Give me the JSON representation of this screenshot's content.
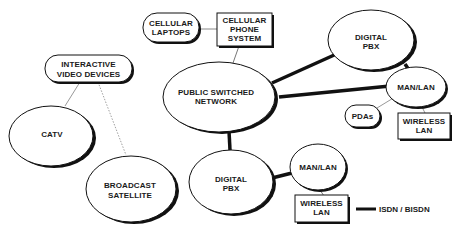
{
  "diagram": {
    "type": "network-topology",
    "nodes": {
      "cellular_laptops": {
        "line1": "CELLULAR",
        "line2": "LAPTOPS",
        "shape": "pill"
      },
      "cellular_phone_system": {
        "line1": "CELLULAR",
        "line2": "PHONE",
        "line3": "SYSTEM",
        "shape": "box"
      },
      "public_switched_network": {
        "line1": "PUBLIC SWITCHED",
        "line2": "NETWORK",
        "shape": "ellipse"
      },
      "digital_pbx_top": {
        "line1": "DIGITAL",
        "line2": "PBX",
        "shape": "ellipse"
      },
      "man_lan_right": {
        "line1": "MAN/LAN",
        "shape": "ellipse"
      },
      "pdas": {
        "line1": "PDAs",
        "shape": "pill"
      },
      "wireless_lan_right": {
        "line1": "WIRELESS",
        "line2": "LAN",
        "shape": "box"
      },
      "interactive_video_devices": {
        "line1": "INTERACTIVE",
        "line2": "VIDEO DEVICES",
        "shape": "pill"
      },
      "catv": {
        "line1": "CATV",
        "shape": "ellipse"
      },
      "broadcast_satellite": {
        "line1": "BROADCAST",
        "line2": "SATELLITE",
        "shape": "ellipse"
      },
      "digital_pbx_bottom": {
        "line1": "DIGITAL",
        "line2": "PBX",
        "shape": "ellipse"
      },
      "man_lan_bottom": {
        "line1": "MAN/LAN",
        "shape": "ellipse"
      },
      "wireless_lan_bottom": {
        "line1": "WIRELESS",
        "line2": "LAN",
        "shape": "box"
      }
    },
    "edges": [
      {
        "from": "cellular_laptops",
        "to": "cellular_phone_system",
        "style": "thin"
      },
      {
        "from": "cellular_phone_system",
        "to": "public_switched_network",
        "style": "thin"
      },
      {
        "from": "public_switched_network",
        "to": "digital_pbx_top",
        "style": "thick"
      },
      {
        "from": "public_switched_network",
        "to": "man_lan_right",
        "style": "thick"
      },
      {
        "from": "digital_pbx_top",
        "to": "man_lan_right",
        "style": "thick"
      },
      {
        "from": "man_lan_right",
        "to": "pdas",
        "style": "thin"
      },
      {
        "from": "man_lan_right",
        "to": "wireless_lan_right",
        "style": "thin"
      },
      {
        "from": "public_switched_network",
        "to": "digital_pbx_bottom",
        "style": "thick"
      },
      {
        "from": "digital_pbx_bottom",
        "to": "man_lan_bottom",
        "style": "thick"
      },
      {
        "from": "man_lan_bottom",
        "to": "wireless_lan_bottom",
        "style": "thin"
      },
      {
        "from": "interactive_video_devices",
        "to": "catv",
        "style": "thin"
      },
      {
        "from": "interactive_video_devices",
        "to": "broadcast_satellite",
        "style": "dotted"
      }
    ],
    "legend": {
      "label": "ISDN / BISDN",
      "line_style": "thick"
    },
    "colors": {
      "stroke": "#111111",
      "fill": "#ffffff",
      "thin_line": "#888888"
    }
  }
}
